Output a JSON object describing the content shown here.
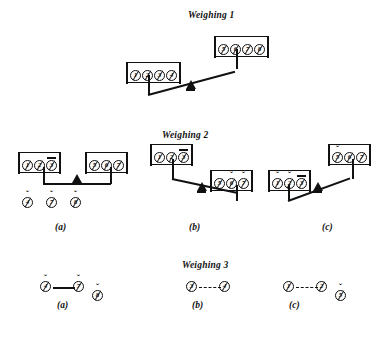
{
  "figure": {
    "title_w1": "Weighing 1",
    "title_w2": "Weighing 2",
    "title_w3": "Weighing 3",
    "caption_a": "(a)",
    "caption_b": "(b)",
    "caption_c": "(c)",
    "ink_color": "#111111",
    "background_color": "#ffffff"
  },
  "marks": {
    "none": "",
    "caron": "ˇ",
    "bar": "bar"
  },
  "weighing1": {
    "left_pan": [
      {
        "num": "1",
        "mark": "none"
      },
      {
        "num": "2",
        "mark": "none"
      },
      {
        "num": "3",
        "mark": "none"
      },
      {
        "num": "4",
        "mark": "none"
      }
    ],
    "right_pan": [
      {
        "num": "5",
        "mark": "none"
      },
      {
        "num": "6",
        "mark": "none"
      },
      {
        "num": "7",
        "mark": "none"
      },
      {
        "num": "8",
        "mark": "none"
      }
    ],
    "tilt": "right-down"
  },
  "weighing2": {
    "panel_a": {
      "left_pan": [
        {
          "num": "1",
          "mark": "none"
        },
        {
          "num": "2",
          "mark": "none"
        },
        {
          "num": "3",
          "mark": "bar"
        }
      ],
      "right_pan": [
        {
          "num": "5",
          "mark": "none"
        },
        {
          "num": "6",
          "mark": "none"
        },
        {
          "num": "7",
          "mark": "none"
        }
      ],
      "tilt": "balanced",
      "conclusion": [
        {
          "num": "4",
          "mark": "caron"
        },
        {
          "num": "7",
          "mark": "caron"
        },
        {
          "num": "8",
          "mark": "caron"
        }
      ],
      "caption": "(a)"
    },
    "panel_b": {
      "left_pan": [
        {
          "num": "1",
          "mark": "none"
        },
        {
          "num": "2",
          "mark": "none"
        },
        {
          "num": "3",
          "mark": "bar"
        }
      ],
      "right_pan": [
        {
          "num": "5",
          "mark": "none"
        },
        {
          "num": "6",
          "mark": "caron"
        },
        {
          "num": "7",
          "mark": "caron"
        }
      ],
      "tilt": "left-down",
      "caption": "(b)"
    },
    "panel_c": {
      "left_pan": [
        {
          "num": "1",
          "mark": "caron"
        },
        {
          "num": "2",
          "mark": "caron"
        },
        {
          "num": "3",
          "mark": "bar"
        }
      ],
      "right_pan": [
        {
          "num": "5",
          "mark": "caron"
        },
        {
          "num": "6",
          "mark": "none"
        },
        {
          "num": "7",
          "mark": "none"
        }
      ],
      "tilt": "right-down",
      "caption": "(c)"
    }
  },
  "weighing3": {
    "panel_a": {
      "pair": [
        {
          "num": "4",
          "mark": "caron"
        },
        {
          "num": "7",
          "mark": "caron"
        }
      ],
      "single": {
        "num": "8",
        "mark": "caron"
      },
      "caption": "(a)"
    },
    "panel_b": {
      "pair": [
        {
          "num": "3",
          "mark": "none"
        },
        {
          "num": "4",
          "mark": "none"
        }
      ],
      "single": null,
      "caption": "(b)"
    },
    "panel_c": {
      "pair": [
        {
          "num": "1",
          "mark": "none"
        },
        {
          "num": "2",
          "mark": "none"
        }
      ],
      "single": {
        "num": "5",
        "mark": "caron"
      },
      "caption": "(c)"
    }
  }
}
